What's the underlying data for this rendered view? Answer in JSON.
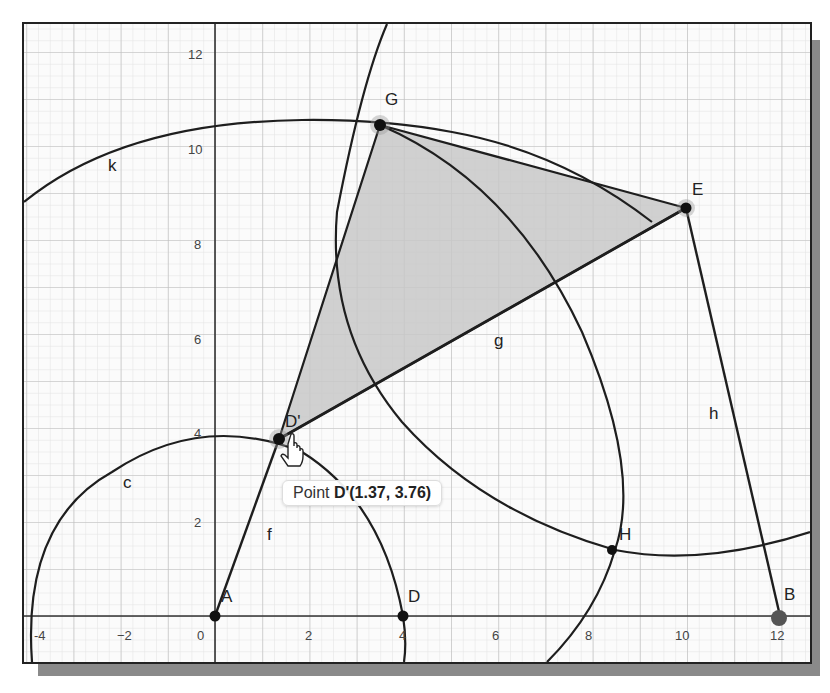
{
  "axes": {
    "x_ticks": [
      "-4",
      "−2",
      "0",
      "2",
      "4",
      "6",
      "8",
      "10",
      "12"
    ],
    "y_ticks": [
      "2",
      "4",
      "6",
      "8",
      "10",
      "12"
    ]
  },
  "points": {
    "A": {
      "label": "A",
      "x": 0,
      "y": 0
    },
    "B": {
      "label": "B",
      "x": 12,
      "y": 0
    },
    "D": {
      "label": "D",
      "x": 4,
      "y": 0
    },
    "Dprime": {
      "label": "D'",
      "x": 1.37,
      "y": 3.76
    },
    "E": {
      "label": "E",
      "x": 10,
      "y": 8.8
    },
    "G": {
      "label": "G",
      "x": 3.5,
      "y": 11.1
    },
    "H": {
      "label": "H",
      "x": 8.5,
      "y": 1.5
    }
  },
  "objects": {
    "circle_c": "c",
    "circle_k": "k",
    "segment_f": "f",
    "segment_g": "g",
    "segment_h": "h"
  },
  "tooltip": {
    "prefix": "Point ",
    "name": "D'(1.37, 3.76)"
  },
  "colors": {
    "polygon_fill": "#c8c8c8",
    "line": "#1e1e1e",
    "grid_major": "#bcbcbc",
    "grid_minor": "#e2e2e2"
  }
}
